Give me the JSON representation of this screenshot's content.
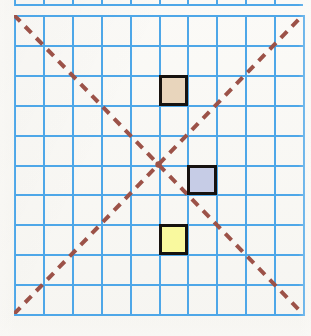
{
  "figure": {
    "type": "geometry-grid-diagram",
    "background_color": "#faf9f6",
    "title": "",
    "caption": ""
  },
  "grid": {
    "columns": 10,
    "rows": 10,
    "line_color": "#4ea7e8",
    "line_width_px": 2,
    "left_px": 14,
    "top_px": 15,
    "width_px": 289,
    "height_px": 299,
    "cell_width_px": 28.9,
    "cell_height_px": 29.9
  },
  "top_partial_strip": {
    "visible": true,
    "description": "cut-off grid row from adjacent figure above",
    "line_color": "#4ea7e8"
  },
  "diagonals": [
    {
      "name": "diagonal-down-right",
      "from": {
        "col": 0,
        "row": 0
      },
      "to": {
        "col": 10,
        "row": 10
      },
      "style": "dashed",
      "color": "#9c5248",
      "width_px": 4,
      "dash_px": 9,
      "gap_px": 7
    },
    {
      "name": "diagonal-up-right",
      "from": {
        "col": 0,
        "row": 10
      },
      "to": {
        "col": 10,
        "row": 0
      },
      "style": "dashed",
      "color": "#9c5248",
      "width_px": 4,
      "dash_px": 9,
      "gap_px": 7
    }
  ],
  "intersection": {
    "col": 5,
    "row": 5,
    "x_px": 158.5,
    "y_px": 164.5,
    "marker_color": "#9c5248"
  },
  "squares": [
    {
      "name": "tan-square",
      "label": "",
      "fill_color": "#e8d5bc",
      "border_color": "#16120f",
      "border_width_px": 3,
      "col": 5,
      "row": 2,
      "x_px": 144.5,
      "y_px": 59.8,
      "width_px": 28.9,
      "height_px": 29.9
    },
    {
      "name": "blue-square",
      "label": "",
      "fill_color": "#c6ccE6",
      "border_color": "#16120f",
      "border_width_px": 3,
      "col": 6,
      "row": 5,
      "x_px": 173.4,
      "y_px": 149.5,
      "width_px": 28.9,
      "height_px": 29.9
    },
    {
      "name": "yellow-square",
      "label": "",
      "fill_color": "#f9f99e",
      "border_color": "#16120f",
      "border_width_px": 3,
      "col": 5,
      "row": 7,
      "x_px": 144.5,
      "y_px": 209.3,
      "width_px": 28.9,
      "height_px": 29.9
    }
  ]
}
